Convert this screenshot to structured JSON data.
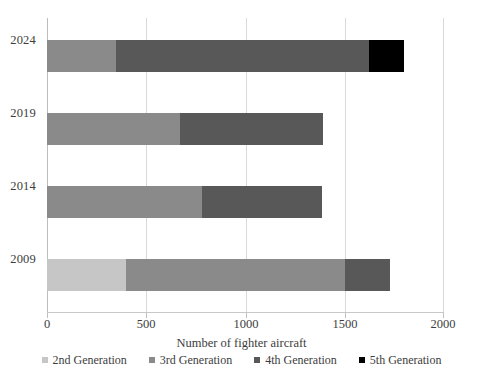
{
  "chart_data": {
    "type": "bar",
    "orientation": "horizontal",
    "stacked": true,
    "title": "",
    "xlabel": "Number of fighter aircraft",
    "ylabel": "",
    "xlim": [
      0,
      2000
    ],
    "xticks": [
      0,
      500,
      1000,
      1500,
      2000
    ],
    "xtick_labels": [
      "0",
      "500",
      "1000",
      "1500",
      "2000"
    ],
    "categories": [
      "2024",
      "2019",
      "2014",
      "2009"
    ],
    "grid": "vertical",
    "legend_position": "bottom",
    "series": [
      {
        "name": "2nd Generation",
        "color": "#c6c6c6",
        "values": [
          0,
          0,
          0,
          400
        ]
      },
      {
        "name": "3rd Generation",
        "color": "#8a8a8a",
        "values": [
          350,
          670,
          780,
          1100
        ]
      },
      {
        "name": "4th Generation",
        "color": "#585858",
        "values": [
          1270,
          720,
          605,
          230
        ]
      },
      {
        "name": "5th Generation",
        "color": "#000000",
        "values": [
          180,
          0,
          0,
          0
        ]
      }
    ],
    "totals": [
      1800,
      1390,
      1385,
      1730
    ]
  },
  "axis": {
    "x_title": "Number of fighter aircraft",
    "tick_labels": [
      "0",
      "500",
      "1000",
      "1500",
      "2000"
    ],
    "year_labels": [
      "2024",
      "2019",
      "2014",
      "2009"
    ]
  },
  "legend": {
    "items": [
      {
        "label": "2nd Generation",
        "color": "#c6c6c6"
      },
      {
        "label": "3rd Generation",
        "color": "#8a8a8a"
      },
      {
        "label": "4th Generation",
        "color": "#585858"
      },
      {
        "label": "5th Generation",
        "color": "#000000"
      }
    ]
  }
}
